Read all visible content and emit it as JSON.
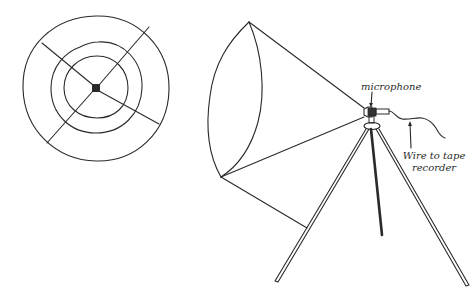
{
  "figure": {
    "type": "illustration",
    "subjects": [
      "parabolic reflector front view",
      "parabolic reflector microphone on tripod side view"
    ]
  },
  "labels": {
    "microphone": "microphone",
    "wire_line1": "Wire to tape",
    "wire_line2": "recorder"
  },
  "colors": {
    "ink": "#2a2a2a",
    "background": "#ffffff"
  }
}
